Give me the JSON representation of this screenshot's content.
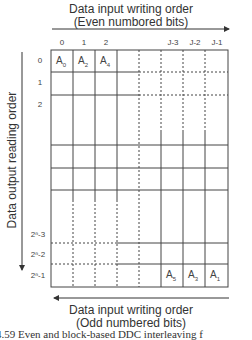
{
  "top_title": {
    "line1": "Data input writing order",
    "line2": "(Even numbored bits)"
  },
  "bottom_title": {
    "line1": "Data input writing order",
    "line2": "(Odd numbered bits)"
  },
  "side_title": "Data output reading order",
  "column_labels": [
    "0",
    "1",
    "2",
    "J-3",
    "J-2",
    "J-1"
  ],
  "row_labels": [
    "0",
    "1",
    "2",
    "2ⁿ-3",
    "2ⁿ-2",
    "2ⁿ-1"
  ],
  "top_cells": [
    {
      "base": "A",
      "sub": "0"
    },
    {
      "base": "A",
      "sub": "2"
    },
    {
      "base": "A",
      "sub": "4"
    }
  ],
  "bottom_cells": [
    {
      "base": "A",
      "sub": "5"
    },
    {
      "base": "A",
      "sub": "3"
    },
    {
      "base": "A",
      "sub": "1"
    }
  ],
  "caption": "4.59   Even and block-based DDC interleaving f"
}
